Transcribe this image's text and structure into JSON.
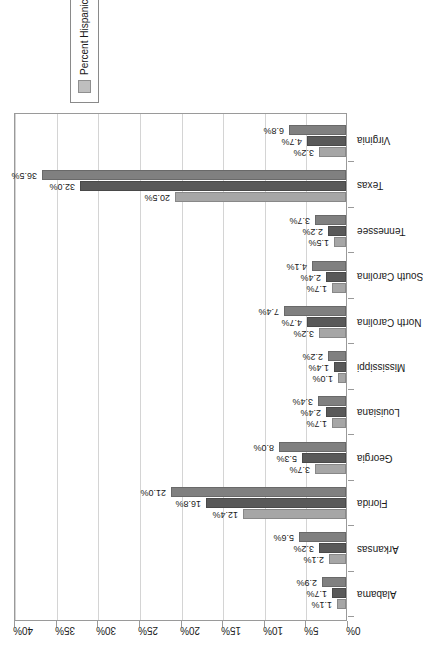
{
  "chart_data": {
    "type": "bar",
    "title": "",
    "xlabel": "",
    "ylabel": "",
    "ylim": [
      0,
      40
    ],
    "grid": true,
    "legend_position": "right",
    "orientation": "vertical-grouped",
    "categories": [
      "Alabama",
      "Arkansas",
      "Florida",
      "Georgia",
      "Louisiana",
      "Mississippi",
      "North Carolina",
      "South Carolina",
      "Tennessee",
      "Texas",
      "Virginia"
    ],
    "tick_labels": [
      "0%",
      "5%",
      "10%",
      "15%",
      "20%",
      "25%",
      "30%",
      "35%",
      "40%"
    ],
    "tick_values": [
      0,
      5,
      10,
      15,
      20,
      25,
      30,
      35,
      40
    ],
    "series": [
      {
        "name": "Percent Hispanic 2008",
        "color": "#a6a6a6",
        "values": [
          1.1,
          2.1,
          12.4,
          3.7,
          1.7,
          1.0,
          3.2,
          1.7,
          1.5,
          20.5,
          3.2
        ],
        "labels": [
          "1.1%",
          "2.1%",
          "12.4%",
          "3.7%",
          "1.7%",
          "1.0%",
          "3.2%",
          "1.7%",
          "1.5%",
          "20.5%",
          "3.2%"
        ]
      },
      {
        "name": "Percent Hispanic 2000",
        "color": "#595959",
        "values": [
          1.7,
          3.2,
          16.8,
          5.3,
          2.4,
          1.4,
          4.7,
          2.4,
          2.2,
          32.0,
          4.7
        ],
        "labels": [
          "1.7%",
          "3.2%",
          "16.8%",
          "5.3%",
          "2.4%",
          "1.4%",
          "4.7%",
          "2.4%",
          "2.2%",
          "32.0%",
          "4.7%"
        ]
      },
      {
        "name": "Percent Hispanic VAP 2000",
        "color": "#808080",
        "values": [
          2.9,
          5.6,
          21.0,
          8.0,
          3.4,
          2.2,
          7.4,
          4.1,
          3.7,
          36.5,
          6.8
        ],
        "labels": [
          "2.9%",
          "5.6%",
          "21.0%",
          "8.0%",
          "3.4%",
          "2.2%",
          "7.4%",
          "4.1%",
          "3.7%",
          "36.5%",
          "6.8%"
        ]
      }
    ],
    "legend": [
      {
        "label": "Percent Hispanic 2008",
        "color": "#a6a6a6"
      },
      {
        "label": "Percent Hispanic 2000",
        "color": "#595959"
      },
      {
        "label": "Percent Hispanic VAP 2000",
        "color": "#bfbfbf"
      }
    ]
  }
}
